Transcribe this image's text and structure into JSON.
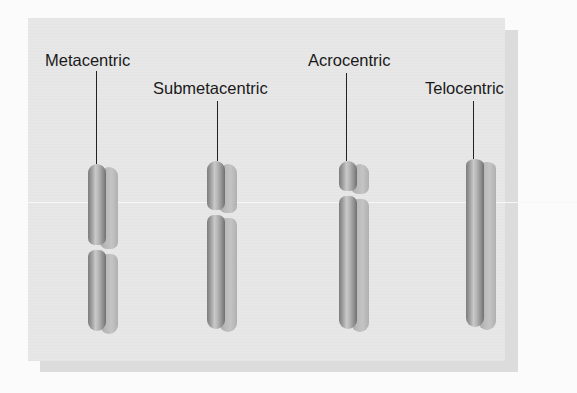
{
  "figure": {
    "title": "",
    "chromosomes": [
      {
        "label": "Metacentric",
        "type": "metacentric",
        "centromere_position": "middle"
      },
      {
        "label": "Submetacentric",
        "type": "submetacentric",
        "centromere_position": "off-center"
      },
      {
        "label": "Acrocentric",
        "type": "acrocentric",
        "centromere_position": "near end"
      },
      {
        "label": "Telocentric",
        "type": "telocentric",
        "centromere_position": "at end"
      }
    ],
    "colors": {
      "panel_background": "#e7e7e7",
      "panel_shadow": "#dcdcdc",
      "chromosome_dark": "#7d7d7d",
      "chromosome_light": "#c9c9c9",
      "label_text": "#1a1a1a"
    }
  }
}
